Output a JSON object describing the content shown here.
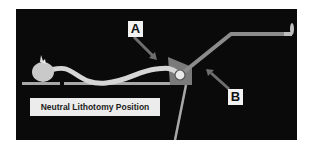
{
  "figure": {
    "caption": "Neutral Lithotomy Position",
    "labels": [
      {
        "id": "A",
        "text": "A"
      },
      {
        "id": "B",
        "text": "B"
      }
    ],
    "colors": {
      "background": "#0a0a0a",
      "body": "#d6d6d6",
      "table": "#a8a8a8",
      "stirrup_block": "#7a7a7a",
      "leg_rod": "#8c8c8c",
      "arrow": "#6e6e6e",
      "label_box": "#f2f2f2",
      "caption_box": "#ececec"
    }
  }
}
